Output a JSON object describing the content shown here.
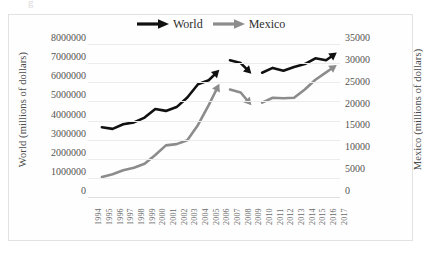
{
  "figure": {
    "top_cut_text": "g",
    "legend": [
      {
        "label": "World",
        "color": "#111111",
        "icon": "arrow-right-icon"
      },
      {
        "label": "Mexico",
        "color": "#8c8c8c",
        "icon": "arrow-right-icon"
      }
    ]
  },
  "chart_data": {
    "type": "line",
    "title": "",
    "xlabel": "",
    "grid": true,
    "legend_position": "top-center",
    "series_colors": {
      "World": "#111111",
      "Mexico": "#8c8c8c"
    },
    "left_axis": {
      "label": "World (millions of dollars)",
      "ylim": [
        0,
        8000000
      ],
      "ticks": [
        "0",
        "1000000",
        "2000000",
        "3000000",
        "4000000",
        "5000000",
        "6000000",
        "7000000",
        "8000000"
      ],
      "tick_values": [
        0,
        1000000,
        2000000,
        3000000,
        4000000,
        5000000,
        6000000,
        7000000,
        8000000
      ]
    },
    "right_axis": {
      "label": "Mexico (millions of dollars)",
      "ylim": [
        0,
        35000
      ],
      "ticks": [
        "0",
        "5000",
        "10000",
        "15000",
        "20000",
        "25000",
        "30000",
        "35000"
      ],
      "tick_values": [
        0,
        5000,
        10000,
        15000,
        20000,
        25000,
        30000,
        35000
      ]
    },
    "categories": [
      "1994",
      "1995",
      "1996",
      "1997",
      "1998",
      "1999",
      "2000",
      "2001",
      "2002",
      "2003",
      "2004",
      "2005",
      "2006",
      "2007",
      "2008",
      "2009",
      "2010",
      "2011",
      "2012",
      "2013",
      "2014",
      "2015",
      "2016",
      "2017"
    ],
    "segments": [
      {
        "name": "1995-2006",
        "years": [
          "1995",
          "1996",
          "1997",
          "1998",
          "1999",
          "2000",
          "2001",
          "2002",
          "2003",
          "2004",
          "2005",
          "2006"
        ]
      },
      {
        "name": "2007-2009",
        "years": [
          "2007",
          "2008",
          "2009"
        ]
      },
      {
        "name": "2010-2017",
        "years": [
          "2010",
          "2011",
          "2012",
          "2013",
          "2014",
          "2015",
          "2016",
          "2017"
        ]
      }
    ],
    "series": [
      {
        "name": "World",
        "axis": "left",
        "arrow_terminators": true,
        "points": [
          {
            "year": "1995",
            "value": 3650000
          },
          {
            "year": "1996",
            "value": 3560000
          },
          {
            "year": "1997",
            "value": 3800000
          },
          {
            "year": "1998",
            "value": 3900000
          },
          {
            "year": "1999",
            "value": 4150000
          },
          {
            "year": "2000",
            "value": 4600000
          },
          {
            "year": "2001",
            "value": 4500000
          },
          {
            "year": "2002",
            "value": 4700000
          },
          {
            "year": "2003",
            "value": 5200000
          },
          {
            "year": "2004",
            "value": 5900000
          },
          {
            "year": "2005",
            "value": 6100000
          },
          {
            "year": "2006",
            "value": 6650000
          },
          {
            "year": "2007",
            "value": 7150000
          },
          {
            "year": "2008",
            "value": 7000000
          },
          {
            "year": "2009",
            "value": 6450000
          },
          {
            "year": "2010",
            "value": 6500000
          },
          {
            "year": "2011",
            "value": 6750000
          },
          {
            "year": "2012",
            "value": 6600000
          },
          {
            "year": "2013",
            "value": 6800000
          },
          {
            "year": "2014",
            "value": 6950000
          },
          {
            "year": "2015",
            "value": 7250000
          },
          {
            "year": "2016",
            "value": 7150000
          },
          {
            "year": "2017",
            "value": 7550000
          }
        ]
      },
      {
        "name": "Mexico",
        "axis": "right",
        "arrow_terminators": true,
        "points": [
          {
            "year": "1995",
            "value": 4600
          },
          {
            "year": "1996",
            "value": 5200
          },
          {
            "year": "1997",
            "value": 6100
          },
          {
            "year": "1998",
            "value": 6700
          },
          {
            "year": "1999",
            "value": 7600
          },
          {
            "year": "2000",
            "value": 9600
          },
          {
            "year": "2001",
            "value": 11800
          },
          {
            "year": "2002",
            "value": 12100
          },
          {
            "year": "2003",
            "value": 13000
          },
          {
            "year": "2004",
            "value": 16500
          },
          {
            "year": "2005",
            "value": 21000
          },
          {
            "year": "2006",
            "value": 25900
          },
          {
            "year": "2007",
            "value": 24600
          },
          {
            "year": "2008",
            "value": 23900
          },
          {
            "year": "2009",
            "value": 21000
          },
          {
            "year": "2010",
            "value": 21600
          },
          {
            "year": "2011",
            "value": 22700
          },
          {
            "year": "2012",
            "value": 22600
          },
          {
            "year": "2013",
            "value": 22700
          },
          {
            "year": "2014",
            "value": 24600
          },
          {
            "year": "2015",
            "value": 26800
          },
          {
            "year": "2016",
            "value": 28500
          },
          {
            "year": "2017",
            "value": 30200
          }
        ]
      }
    ]
  }
}
